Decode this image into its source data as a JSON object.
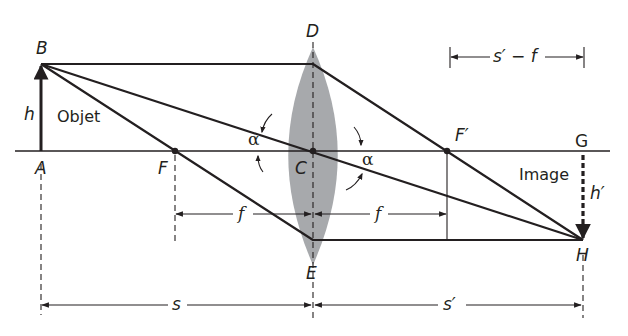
{
  "diagram": {
    "type": "thin-lens-ray-diagram",
    "points": {
      "A": "A",
      "B": "B",
      "C": "C",
      "D": "D",
      "E": "E",
      "F": "F",
      "F_prime": "F′",
      "G": "G",
      "H": "H"
    },
    "labels": {
      "object": "Objet",
      "image": "Image",
      "object_height": "h",
      "image_height": "h′",
      "angle_left": "α",
      "angle_right": "α"
    },
    "dimensions": {
      "focal_left": "f",
      "focal_right": "f",
      "object_distance": "s",
      "image_distance": "s′",
      "image_minus_focal": "s′ − f"
    },
    "colors": {
      "ink": "#231f20",
      "lens_fill": "#a7a9ac",
      "background": "#ffffff"
    }
  }
}
